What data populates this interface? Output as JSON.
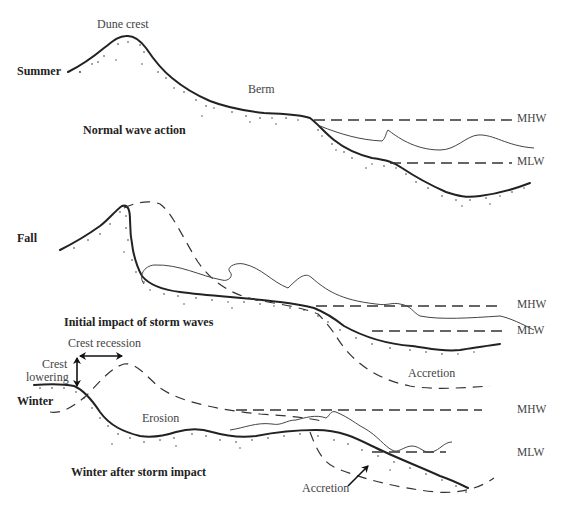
{
  "figure": {
    "type": "beach profile seasonal change diagram",
    "panels": [
      {
        "season": "Summer",
        "caption": "Normal wave action",
        "labels": [
          "Dune crest",
          "Berm",
          "MHW",
          "MLW"
        ]
      },
      {
        "season": "Fall",
        "caption": "Initial impact of storm waves",
        "labels": [
          "MHW",
          "MLW",
          "Accretion"
        ]
      },
      {
        "season": "Winter",
        "caption": "Winter after storm impact",
        "labels": [
          "Crest recession",
          "Crest lowering",
          "Erosion",
          "MHW",
          "MLW",
          "Accretion"
        ]
      }
    ]
  },
  "summer": {
    "season": "Summer",
    "dune_crest": "Dune crest",
    "berm": "Berm",
    "caption": "Normal wave action",
    "mhw": "MHW",
    "mlw": "MLW"
  },
  "fall": {
    "season": "Fall",
    "caption": "Initial impact of storm waves",
    "mhw": "MHW",
    "mlw": "MLW",
    "accretion": "Accretion"
  },
  "winter": {
    "season": "Winter",
    "crest_recession": "Crest recession",
    "crest_lowering_1": "Crest",
    "crest_lowering_2": "lowering",
    "erosion": "Erosion",
    "caption": "Winter after storm impact",
    "mhw": "MHW",
    "mlw": "MLW",
    "accretion": "Accretion"
  }
}
